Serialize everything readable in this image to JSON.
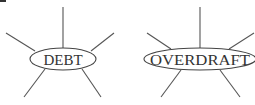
{
  "diagrams": [
    {
      "label": "DEBT",
      "spokes": 5
    },
    {
      "label": "OVERDRAFT",
      "spokes": 5
    }
  ]
}
